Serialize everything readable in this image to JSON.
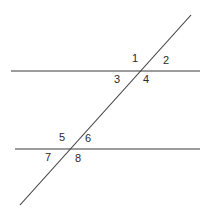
{
  "diagram": {
    "line_color": "#3a3a3a",
    "lines": {
      "parallel_top": {
        "x1": 11,
        "y1": 71,
        "x2": 200,
        "y2": 71
      },
      "parallel_bottom": {
        "x1": 15,
        "y1": 149,
        "x2": 200,
        "y2": 149
      },
      "transversal": {
        "x1": 191,
        "y1": 15,
        "x2": 20,
        "y2": 205
      }
    },
    "angle_labels": [
      {
        "text": "1",
        "x": 132,
        "y": 62
      },
      {
        "text": "2",
        "x": 163,
        "y": 64
      },
      {
        "text": "3",
        "x": 114,
        "y": 83
      },
      {
        "text": "4",
        "x": 143,
        "y": 83
      },
      {
        "text": "5",
        "x": 59,
        "y": 141
      },
      {
        "text": "6",
        "x": 85,
        "y": 142
      },
      {
        "text": "7",
        "x": 45,
        "y": 161
      },
      {
        "text": "8",
        "x": 75,
        "y": 162
      }
    ]
  }
}
